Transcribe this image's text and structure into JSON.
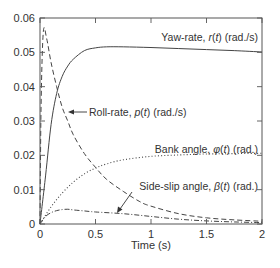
{
  "chart_data": {
    "type": "line",
    "title": "",
    "xlabel": "Time (s)",
    "ylabel": "",
    "xlim": [
      0,
      2
    ],
    "ylim": [
      0,
      0.06
    ],
    "grid": false,
    "legend": "inline annotations",
    "x_ticks": [
      "0",
      "0.5",
      "1",
      "1.5",
      "2"
    ],
    "y_ticks": [
      "0",
      "0.01",
      "0.02",
      "0.03",
      "0.04",
      "0.05",
      "0.06"
    ],
    "series": [
      {
        "name": "Yaw-rate, r(t) (rad./s)",
        "style": "solid",
        "x": [
          0,
          0.05,
          0.1,
          0.15,
          0.2,
          0.25,
          0.3,
          0.4,
          0.5,
          0.6,
          0.75,
          1.0,
          1.25,
          1.5,
          1.75,
          2.0
        ],
        "values": [
          0,
          0.014,
          0.029,
          0.038,
          0.043,
          0.046,
          0.048,
          0.0505,
          0.0513,
          0.0516,
          0.0516,
          0.0514,
          0.0511,
          0.0508,
          0.0505,
          0.0501
        ]
      },
      {
        "name": "Roll-rate, p(t) (rad./s)",
        "style": "dashed",
        "x": [
          0,
          0.01,
          0.03,
          0.06,
          0.1,
          0.15,
          0.2,
          0.25,
          0.3,
          0.4,
          0.5,
          0.6,
          0.75,
          0.9,
          1.0,
          1.25,
          1.5,
          1.75,
          2.0
        ],
        "values": [
          0,
          0.035,
          0.056,
          0.054,
          0.047,
          0.04,
          0.034,
          0.03,
          0.026,
          0.0205,
          0.0165,
          0.013,
          0.0095,
          0.0065,
          0.0052,
          0.003,
          0.0018,
          0.0012,
          0.0008
        ]
      },
      {
        "name": "Bank angle, φ(t) (rad.)",
        "style": "dotted",
        "x": [
          0,
          0.1,
          0.2,
          0.3,
          0.4,
          0.5,
          0.6,
          0.75,
          1.0,
          1.25,
          1.5,
          1.75,
          2.0
        ],
        "values": [
          0,
          0.005,
          0.009,
          0.0122,
          0.0146,
          0.0163,
          0.0175,
          0.0187,
          0.0197,
          0.0201,
          0.0204,
          0.0205,
          0.0206
        ]
      },
      {
        "name": "Side-slip angle, β(t) (rad.)",
        "style": "dash-dot",
        "x": [
          0,
          0.05,
          0.1,
          0.15,
          0.2,
          0.25,
          0.3,
          0.4,
          0.5,
          0.75,
          1.0,
          1.25,
          1.5,
          1.75,
          2.0
        ],
        "values": [
          0,
          0.0022,
          0.0033,
          0.0039,
          0.0042,
          0.0043,
          0.0041,
          0.0038,
          0.0035,
          0.003,
          0.0022,
          0.0014,
          0.0009,
          0.0006,
          0.0004
        ]
      }
    ],
    "annotations": [
      {
        "text": "Yaw-rate, r(t) (rad./s)",
        "x": 1.55,
        "y": 0.055,
        "arrow": false
      },
      {
        "text": "Roll-rate, p(t) (rad./s)",
        "x": 0.55,
        "y": 0.0285,
        "arrow": true,
        "arrow_to": [
          0.26,
          0.0285
        ]
      },
      {
        "text": "Bank angle, φ(t) (rad.)",
        "x": 1.55,
        "y": 0.0245,
        "arrow": false
      },
      {
        "text": "Side-slip angle, β(t) (rad.)",
        "x": 1.2,
        "y": 0.0115,
        "arrow": true,
        "arrow_to": [
          0.72,
          0.0032
        ]
      }
    ]
  },
  "labels": {
    "xlabel": "Time (s)",
    "yaw_prefix": "Yaw-rate, ",
    "yaw_var": "r",
    "yaw_paren": "(",
    "yaw_t": "t",
    "yaw_suffix": ") (rad./s)",
    "roll_prefix": "Roll-rate, ",
    "roll_var": "p",
    "roll_open": "(",
    "roll_t": "t",
    "roll_suffix": ") (rad./s)",
    "bank_prefix": "Bank angle, ",
    "bank_var": "φ",
    "bank_open": "(",
    "bank_t": "t",
    "bank_suffix": ") (rad.)",
    "slip_prefix": "Side-slip angle, ",
    "slip_var": "β",
    "slip_open": "(",
    "slip_t": "t",
    "slip_suffix": ") (rad.)"
  },
  "colors": {
    "axis": "#555555",
    "line": "#444444",
    "text": "#333333"
  }
}
